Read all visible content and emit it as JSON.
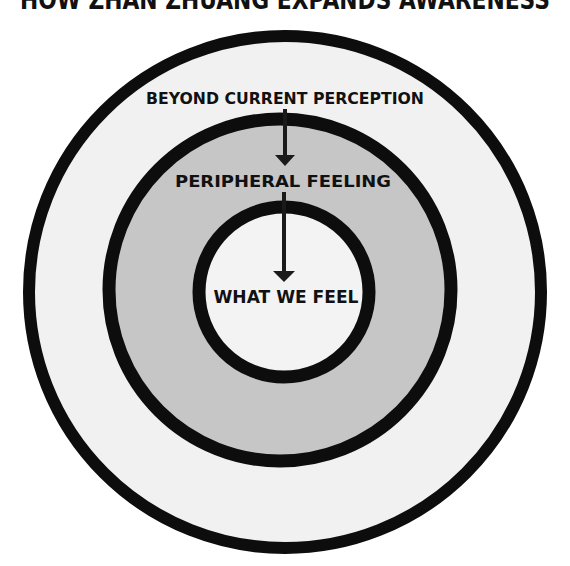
{
  "title": "HOW ZHAN ZHUANG EXPANDS AWARENESS",
  "rings": [
    {
      "id": "outer",
      "label": "BEYOND CURRENT PERCEPTION",
      "fill": "#f1f1f1"
    },
    {
      "id": "middle",
      "label": "PERIPHERAL FEELING",
      "fill": "#c6c6c6"
    },
    {
      "id": "inner",
      "label": "WHAT WE FEEL",
      "fill": "#f3f3f3"
    }
  ],
  "colors": {
    "stroke": "#0d0d0d",
    "text": "#111111",
    "background": "#ffffff"
  },
  "arrows": [
    {
      "from": "BEYOND CURRENT PERCEPTION",
      "to": "PERIPHERAL FEELING"
    },
    {
      "from": "PERIPHERAL FEELING",
      "to": "WHAT WE FEEL"
    }
  ]
}
